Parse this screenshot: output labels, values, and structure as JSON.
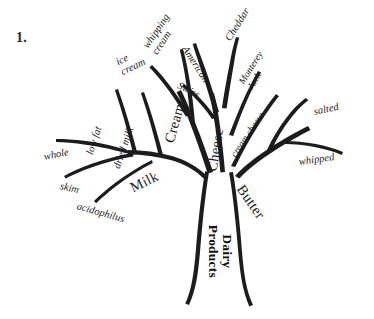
{
  "page": {
    "item_number": "1.",
    "background_color": "#ffffff",
    "ink_color": "#1c1c1c"
  },
  "diagram": {
    "type": "tree-diagram",
    "root": {
      "label": "Dairy\nProducts",
      "style": "bold"
    },
    "branches": [
      {
        "name": "milk",
        "label": "Milk",
        "style": "major",
        "children": [
          {
            "name": "whole",
            "label": "whole"
          },
          {
            "name": "low-fat",
            "label": "low fat"
          },
          {
            "name": "dried-milk",
            "label": "dried milk"
          },
          {
            "name": "skim",
            "label": "skim"
          },
          {
            "name": "acidophilus",
            "label": "acidophilus"
          }
        ]
      },
      {
        "name": "cream",
        "label": "Cream",
        "style": "major",
        "children": [
          {
            "name": "ice-cream",
            "label": "ice\ncream"
          },
          {
            "name": "whipping-cream",
            "label": "whipping\ncream"
          }
        ]
      },
      {
        "name": "cheese",
        "label": "Cheese",
        "style": "major",
        "children": [
          {
            "name": "swiss",
            "label": "Swiss"
          },
          {
            "name": "american",
            "label": "American"
          },
          {
            "name": "cheddar",
            "label": "Cheddar"
          },
          {
            "name": "monterey-jack",
            "label": "Monterey\nJack"
          },
          {
            "name": "cream-cheese",
            "label": "cream cheese"
          }
        ]
      },
      {
        "name": "butter",
        "label": "Butter",
        "style": "major",
        "children": [
          {
            "name": "salted",
            "label": "salted"
          },
          {
            "name": "whipped",
            "label": "whipped"
          }
        ]
      }
    ]
  },
  "labels": {
    "whole": "whole",
    "skim": "skim",
    "acidophilus": "acidophilus",
    "low_fat": "low fat",
    "dried_milk": "dried milk",
    "milk": "Milk",
    "ice_cream": "ice\ncream",
    "whipping_cream": "whipping\ncream",
    "cream": "Cream",
    "swiss": "Swiss",
    "american": "American",
    "cheddar": "Cheddar",
    "monterey_jack": "Monterey\nJack",
    "cream_cheese": "cream cheese",
    "cheese": "Cheese",
    "salted": "salted",
    "whipped": "whipped",
    "butter": "Butter",
    "dairy_products": "Dairy\nProducts"
  }
}
